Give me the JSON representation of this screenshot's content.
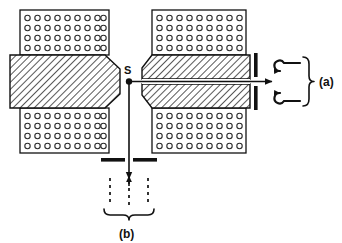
{
  "figure": {
    "background_color": "#ffffff",
    "line_color": "#111111",
    "hatch_color": "#3a3a3a",
    "coil_circle_color": "#2b2b2b"
  },
  "labels": {
    "source": "S",
    "branch_a": "(a)",
    "branch_b": "(b)"
  },
  "components": {
    "coil_top_left": {
      "name": "coil-winding-top-left",
      "rows": 4,
      "per_row": 9
    },
    "coil_bottom_left": {
      "name": "coil-winding-bottom-left",
      "rows": 4,
      "per_row": 9
    },
    "coil_top_right": {
      "name": "coil-winding-top-right",
      "rows": 4,
      "per_row": 10
    },
    "coil_bottom_right": {
      "name": "coil-winding-bottom-right",
      "rows": 4,
      "per_row": 10
    },
    "pole_left": {
      "name": "pole-piece-left",
      "hatched": true
    },
    "pole_right_upper": {
      "name": "pole-piece-right-upper",
      "hatched": true
    },
    "pole_right_lower": {
      "name": "pole-piece-right-lower",
      "hatched": true
    },
    "beam_channel": {
      "name": "beam-channel-right"
    },
    "slit_right": {
      "name": "exit-slit-right",
      "bars": 2
    },
    "slit_bottom": {
      "name": "exit-slit-bottom",
      "bars": 2
    },
    "beam_arrow_right": {
      "name": "beam-arrow-horizontal",
      "direction": "right"
    },
    "beam_arrow_down": {
      "name": "beam-arrow-vertical",
      "direction": "down"
    },
    "detector_lines_b": {
      "name": "detector-trajectory-lines",
      "count": 3,
      "style": "dashed"
    },
    "brace_a": {
      "name": "brace-a"
    },
    "brace_b": {
      "name": "brace-b"
    }
  }
}
